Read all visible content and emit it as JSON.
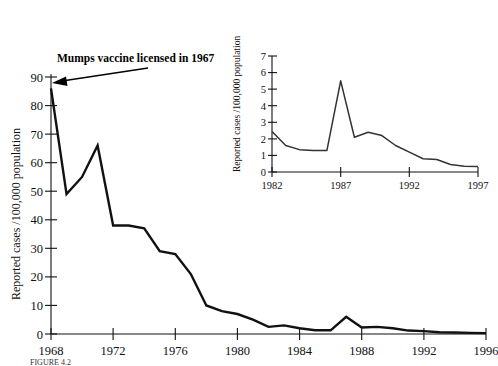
{
  "figure": {
    "annotation": "Mumps vaccine  licensed in 1967",
    "caption": "FIGURE 4.2"
  },
  "chart_data": [
    {
      "id": "main",
      "type": "line",
      "title": "",
      "xlabel": "",
      "ylabel": "Reported cases /100,000 population",
      "xlim": [
        1968,
        1996
      ],
      "ylim": [
        0,
        90
      ],
      "grid": false,
      "legend": "none",
      "xticklabels": [
        "1968",
        "1972",
        "1976",
        "1980",
        "1984",
        "1988",
        "1992",
        "1996"
      ],
      "xtickvalues": [
        1968,
        1972,
        1976,
        1980,
        1984,
        1988,
        1992,
        1996
      ],
      "yticklabels": [
        "0",
        "10",
        "20",
        "30",
        "40",
        "50",
        "60",
        "70",
        "80",
        "90"
      ],
      "ytickvalues": [
        0,
        10,
        20,
        30,
        40,
        50,
        60,
        70,
        80,
        90
      ],
      "x": [
        1968,
        1969,
        1970,
        1971,
        1972,
        1973,
        1974,
        1975,
        1976,
        1977,
        1978,
        1979,
        1980,
        1981,
        1982,
        1983,
        1984,
        1985,
        1986,
        1987,
        1988,
        1989,
        1990,
        1991,
        1992,
        1993,
        1994,
        1995,
        1996
      ],
      "values": [
        86,
        49,
        55,
        66,
        38,
        38,
        37,
        29,
        28,
        21,
        10,
        8,
        7,
        5,
        2.5,
        3,
        2,
        1.3,
        1.3,
        6,
        2.3,
        2.5,
        2,
        1.2,
        1,
        0.6,
        0.5,
        0.4,
        0.3
      ],
      "annotations": [
        {
          "text": "Mumps vaccine  licensed in 1967",
          "points_to_year": 1968,
          "points_to_value": 86
        }
      ]
    },
    {
      "id": "inset",
      "type": "line",
      "title": "",
      "xlabel": "",
      "ylabel": "Reported cases /100,000 population",
      "xlim": [
        1982,
        1997
      ],
      "ylim": [
        0,
        7
      ],
      "grid": false,
      "legend": "none",
      "xticklabels": [
        "1982",
        "1987",
        "1992",
        "1997"
      ],
      "xtickvalues": [
        1982,
        1987,
        1992,
        1997
      ],
      "yticklabels": [
        "0",
        "1",
        "2",
        "3",
        "4",
        "5",
        "6",
        "7"
      ],
      "ytickvalues": [
        0,
        1,
        2,
        3,
        4,
        5,
        6,
        7
      ],
      "x": [
        1982,
        1983,
        1984,
        1985,
        1986,
        1987,
        1988,
        1989,
        1990,
        1991,
        1992,
        1993,
        1994,
        1995,
        1996,
        1997
      ],
      "values": [
        2.45,
        1.6,
        1.35,
        1.3,
        1.3,
        5.5,
        2.1,
        2.4,
        2.2,
        1.6,
        1.2,
        0.8,
        0.75,
        0.45,
        0.35,
        0.33
      ]
    }
  ]
}
